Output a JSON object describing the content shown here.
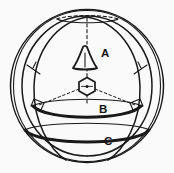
{
  "figure": {
    "background_color": "#fafafa",
    "ink_color": "#1a1a1a",
    "width": 174,
    "height": 173
  },
  "labels": {
    "a": "A",
    "b": "B",
    "c": "C"
  },
  "label_positions": {
    "a": {
      "x": 101,
      "y": 57
    },
    "b": {
      "x": 99,
      "y": 113
    },
    "c": {
      "x": 104,
      "y": 145
    }
  },
  "icons": {
    "cone": "cone-icon",
    "hexagon": "hexagon-icon",
    "axis": "vertical-axis-dashed-line",
    "right_angle_left": "right-angle-marker-left",
    "right_angle_right": "right-angle-marker-right"
  },
  "chart_data": {
    "type": "diagram",
    "elements": [
      {
        "name": "outer-sphere-circle",
        "shape": "circle",
        "cx": 87,
        "cy": 86,
        "r": 77
      },
      {
        "name": "inner-sphere-circle",
        "shape": "circle",
        "cx": 87,
        "cy": 86,
        "r": 70
      },
      {
        "name": "left-meridian-arc",
        "shape": "arc"
      },
      {
        "name": "right-meridian-arc",
        "shape": "arc"
      },
      {
        "name": "top-dashed-ellipse-arc",
        "shape": "dashed-arc"
      },
      {
        "name": "band-b-ellipse",
        "shape": "ellipse-arc",
        "label": "B"
      },
      {
        "name": "band-c-ellipse",
        "shape": "ellipse-arc",
        "label": "C"
      },
      {
        "name": "cone-symbol",
        "shape": "triangle",
        "label": "A"
      },
      {
        "name": "hexagon-center-symbol",
        "shape": "hexagon"
      },
      {
        "name": "vertical-axis",
        "shape": "dashed-line",
        "from": [
          87,
          18
        ],
        "to": [
          87,
          104
        ]
      },
      {
        "name": "radius-left",
        "shape": "dashed-line",
        "from": [
          87,
          86
        ],
        "to": [
          38,
          106
        ]
      },
      {
        "name": "radius-right",
        "shape": "dashed-line",
        "from": [
          87,
          86
        ],
        "to": [
          136,
          106
        ]
      }
    ],
    "labels": [
      "A",
      "B",
      "C"
    ],
    "legend": [],
    "grid": false
  }
}
